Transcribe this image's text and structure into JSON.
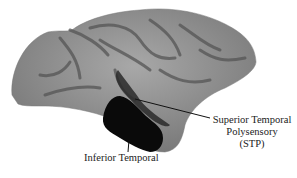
{
  "figure": {
    "labels": {
      "stp_line1": "Superior Temporal",
      "stp_line2": "Polysensory",
      "stp_line3": "(STP)",
      "inferior_temporal": "Inferior Temporal"
    },
    "colors": {
      "cortex": "#8a8a8a",
      "sulci": "#5a5a5a",
      "it_region": "#0a0a0a",
      "leader_line": "#111111"
    }
  }
}
